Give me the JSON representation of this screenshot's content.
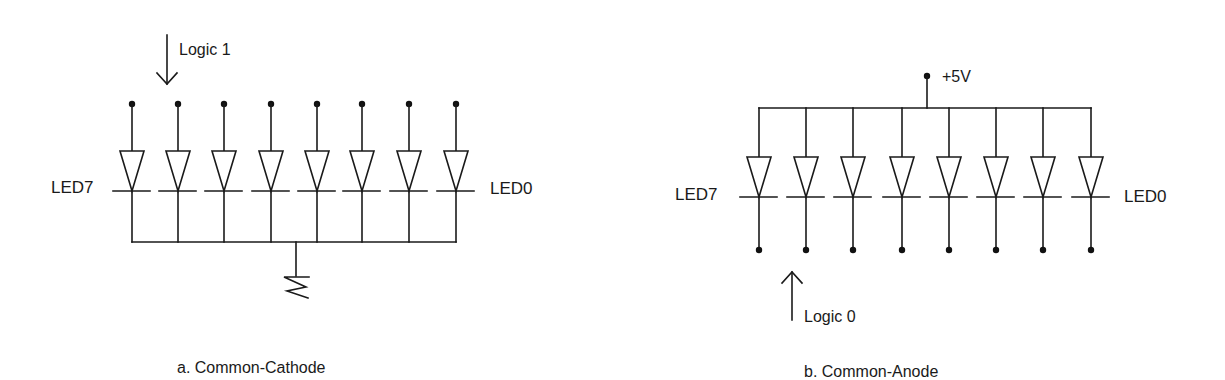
{
  "figure": {
    "panels": [
      {
        "id": "a",
        "caption": "a. Common-Cathode",
        "left_label": "LED7",
        "right_label": "LED0",
        "drive_label": "Logic 1",
        "drive_arrow": "down",
        "common_node": "ground",
        "diode_count": 8,
        "diode_x": [
          132,
          178,
          224,
          271,
          317,
          362,
          409,
          456
        ]
      },
      {
        "id": "b",
        "caption": "b. Common-Anode",
        "left_label": "LED7",
        "right_label": "LED0",
        "drive_label": "Logic 0",
        "drive_arrow": "up",
        "supply_label": "+5V",
        "common_node": "supply",
        "diode_count": 8,
        "diode_x": [
          759,
          806,
          853,
          902,
          949,
          996,
          1043,
          1091
        ]
      }
    ]
  },
  "colors": {
    "ink": "#1a1a1a",
    "background": "#ffffff"
  }
}
